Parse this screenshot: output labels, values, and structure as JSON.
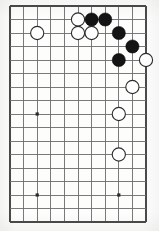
{
  "board": {
    "title": "Go board diagram",
    "description": "Cropped go board showing a joseki corner sequence in the upper right area",
    "visible_columns": 11,
    "visible_rows": 17,
    "grid_spacing_px": 13.6,
    "origin_x_px": 10,
    "origin_y_px": 6,
    "row_spacing_px": 13.5,
    "line_color": "#6b6b6b",
    "edge_color": "#4a4a4a",
    "background_color": "#fdfdfc",
    "black_color": "#141414",
    "white_color": "#fefefe",
    "stone_radius_px": 6.6,
    "star_point_radius_px": 1.6,
    "star_points": [
      {
        "name": "star-point-left-middle",
        "col": 2,
        "row": 8
      },
      {
        "name": "star-point-left-bottom",
        "col": 2,
        "row": 14
      },
      {
        "name": "star-point-center-bottom",
        "col": 8,
        "row": 14
      }
    ],
    "stones": [
      {
        "name": "white-stone-left-upper",
        "color": "white",
        "col": 2,
        "row": 2
      },
      {
        "name": "white-stone-top-a",
        "color": "white",
        "col": 5,
        "row": 1
      },
      {
        "name": "black-stone-top-a",
        "color": "black",
        "col": 6,
        "row": 1
      },
      {
        "name": "black-stone-top-b",
        "color": "black",
        "col": 7,
        "row": 1
      },
      {
        "name": "white-stone-mid-a",
        "color": "white",
        "col": 5,
        "row": 2
      },
      {
        "name": "white-stone-mid-b",
        "color": "white",
        "col": 6,
        "row": 2
      },
      {
        "name": "black-stone-right-a",
        "color": "black",
        "col": 8,
        "row": 2
      },
      {
        "name": "black-stone-right-b",
        "color": "black",
        "col": 9,
        "row": 3
      },
      {
        "name": "black-stone-right-c",
        "color": "black",
        "col": 8,
        "row": 4
      },
      {
        "name": "white-stone-right-a",
        "color": "white",
        "col": 10,
        "row": 4
      },
      {
        "name": "white-stone-right-b",
        "color": "white",
        "col": 9,
        "row": 6
      },
      {
        "name": "white-stone-right-c",
        "color": "white",
        "col": 8,
        "row": 8
      },
      {
        "name": "white-stone-right-d",
        "color": "white",
        "col": 8,
        "row": 11
      }
    ]
  }
}
